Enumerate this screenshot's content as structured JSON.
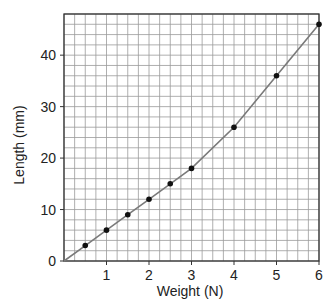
{
  "chart_data": {
    "type": "line",
    "title": "",
    "xlabel": "Weight (N)",
    "ylabel": "Length (mm)",
    "xlim": [
      0,
      6
    ],
    "ylim": [
      0,
      48
    ],
    "x_ticks": [
      1,
      2,
      3,
      4,
      5,
      6
    ],
    "y_ticks": [
      0,
      10,
      20,
      30,
      40
    ],
    "grid": true,
    "grid_x_step": 0.25,
    "grid_y_step": 2,
    "legend": null,
    "series": [
      {
        "name": "Length vs Weight",
        "x": [
          0,
          0.5,
          1,
          1.5,
          2,
          2.5,
          3,
          4,
          5,
          6
        ],
        "y": [
          0,
          3,
          6,
          9,
          12,
          15,
          18,
          26,
          36,
          46
        ],
        "markers_at": [
          0.5,
          1,
          1.5,
          2,
          2.5,
          3,
          4,
          5,
          6
        ],
        "line_color": "#7a7a7a",
        "marker_color": "#111111"
      }
    ]
  },
  "colors": {
    "grid": "#9a9a9a",
    "frame": "#333333",
    "line": "#7a7a7a",
    "marker": "#111111"
  }
}
